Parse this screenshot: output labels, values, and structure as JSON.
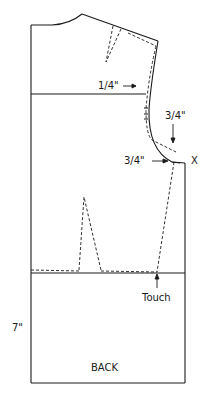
{
  "diagram": {
    "title": "BACK",
    "colors": {
      "stroke": "#1a1a1a",
      "background": "#ffffff"
    },
    "labels": {
      "armhole_shift": "1/4\"",
      "underarm_drop": "3/4\"",
      "side_extension": "3/4\"",
      "point_marker": "X",
      "waist_touch": "Touch",
      "hip_depth": "7\"",
      "piece_name": "BACK"
    },
    "lines": {
      "solid": [
        "neckline",
        "shoulder",
        "armhole",
        "side-seam",
        "center-back",
        "chest-line",
        "waist-line",
        "hem"
      ],
      "dashed": [
        "shoulder-dart",
        "adjusted-shoulder",
        "adjusted-armhole",
        "waist-dart",
        "adjusted-side-seam",
        "adjusted-waist"
      ]
    }
  }
}
